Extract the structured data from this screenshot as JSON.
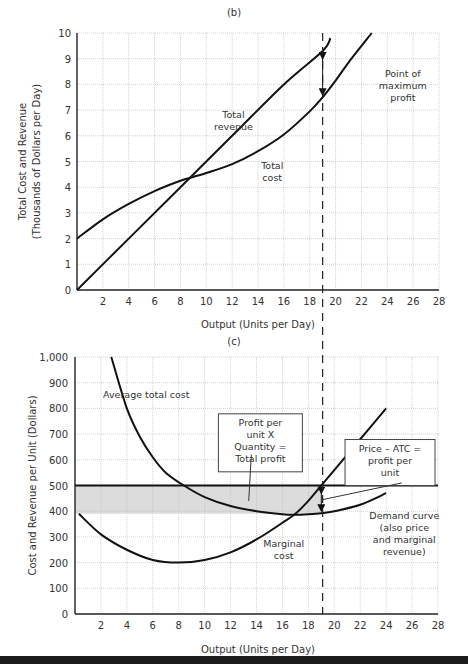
{
  "chart_data": [
    {
      "type": "line",
      "panel_label": "(b)",
      "title": "",
      "xlabel": "Output (Units per Day)",
      "ylabel_lines": [
        "Total Cost and Revenue",
        "(Thousands of Dollars per Day)"
      ],
      "xlim": [
        0,
        28
      ],
      "ylim": [
        0,
        10
      ],
      "x_ticks": [
        2,
        4,
        6,
        8,
        10,
        12,
        14,
        16,
        18,
        20,
        22,
        24,
        26,
        28
      ],
      "y_ticks": [
        0,
        1,
        2,
        3,
        4,
        5,
        6,
        7,
        8,
        9,
        10
      ],
      "grid": true,
      "series": [
        {
          "name": "Total revenue",
          "x": [
            0,
            4,
            8,
            12,
            16,
            19,
            19.6
          ],
          "y": [
            0,
            2,
            4,
            6,
            8,
            9.3,
            9.8
          ]
        },
        {
          "name": "Total cost",
          "x": [
            0,
            2,
            4,
            6,
            8,
            9,
            10,
            12,
            14,
            16,
            18,
            19,
            20,
            21,
            22.8
          ],
          "y": [
            2,
            2.75,
            3.35,
            3.85,
            4.25,
            4.4,
            4.55,
            4.9,
            5.4,
            6.05,
            6.95,
            7.5,
            8.15,
            8.85,
            10
          ]
        }
      ],
      "annotations": [
        {
          "text_lines": [
            "Total",
            "revenue"
          ],
          "x": 12.1,
          "y": 6.7
        },
        {
          "text_lines": [
            "Total",
            "cost"
          ],
          "x": 15.1,
          "y": 4.7
        },
        {
          "text_lines": [
            "Point of",
            "maximum",
            "profit"
          ],
          "x": 25.2,
          "y": 8.3
        }
      ],
      "profit_arrow": {
        "x": 19,
        "from": 9.3,
        "to": 7.5
      },
      "vline_x": 19
    },
    {
      "type": "line",
      "panel_label": "(c)",
      "title": "",
      "xlabel": "Output (Units per Day)",
      "ylabel_lines": [
        "Cost and Revenue per Unit (Dollars)"
      ],
      "xlim": [
        0,
        28
      ],
      "ylim": [
        0,
        1000
      ],
      "x_ticks": [
        2,
        4,
        6,
        8,
        10,
        12,
        14,
        16,
        18,
        20,
        22,
        24,
        26,
        28
      ],
      "y_ticks": [
        0,
        100,
        200,
        300,
        400,
        500,
        600,
        700,
        800,
        900,
        1000
      ],
      "y_tick_labels": [
        "0",
        "100",
        "200",
        "300",
        "400",
        "500",
        "600",
        "700",
        "800",
        "900",
        "1,000"
      ],
      "grid": true,
      "series": [
        {
          "name": "Average total cost",
          "x": [
            2.8,
            4,
            5,
            6,
            7,
            8.4,
            10,
            12,
            14,
            16,
            17,
            18,
            19,
            20,
            22,
            24
          ],
          "y": [
            1000,
            800,
            690,
            610,
            550,
            500,
            455,
            420,
            400,
            388,
            386,
            388,
            392,
            400,
            425,
            470
          ]
        },
        {
          "name": "Marginal cost",
          "x": [
            0.3,
            2,
            4,
            6,
            8,
            10,
            12,
            14,
            16,
            17,
            18,
            19,
            20,
            22,
            24
          ],
          "y": [
            390,
            310,
            250,
            210,
            200,
            210,
            240,
            290,
            355,
            390,
            440,
            500,
            560,
            680,
            800
          ]
        },
        {
          "name": "Demand curve",
          "x": [
            0,
            28
          ],
          "y": [
            500,
            500
          ]
        }
      ],
      "shaded_region": {
        "x": [
          0,
          19
        ],
        "y": [
          390,
          500
        ],
        "label": "Total profit"
      },
      "annotations": [
        {
          "text_lines": [
            "Average total cost"
          ],
          "x": 5.5,
          "y": 840
        },
        {
          "text_lines": [
            "Profit per",
            "unit X",
            "Quantity =",
            "Total profit"
          ],
          "boxed": true,
          "x": 14.3,
          "y": 740
        },
        {
          "text_lines": [
            "Price – ATC =",
            "profit per",
            "unit"
          ],
          "boxed": true,
          "x": 24.3,
          "y": 640
        },
        {
          "text_lines": [
            "Demand curve",
            "(also price",
            "and marginal",
            "revenue)"
          ],
          "x": 25.4,
          "y": 370
        },
        {
          "text_lines": [
            "Marginal",
            "cost"
          ],
          "x": 16.1,
          "y": 260
        }
      ],
      "profit_arrow": {
        "x": 19,
        "from": 500,
        "to": 392
      },
      "vline_x": 19
    }
  ]
}
